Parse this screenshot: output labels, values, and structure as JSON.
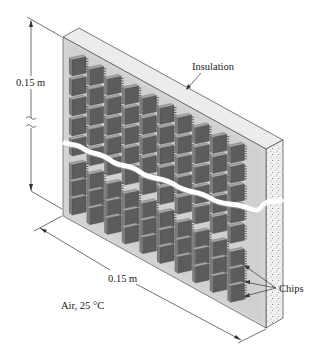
{
  "diagram": {
    "labels": {
      "height_dim": "0.15 m",
      "width_dim": "0.15 m",
      "insulation": "Insulation",
      "chips": "Chips",
      "ambient": "Air, 25 °C"
    },
    "chip_grid": {
      "columns": 10,
      "upper_rows": 5,
      "lower_rows": 3
    },
    "colors": {
      "board": "#d2d2d2",
      "board_edge": "#e8e8e8",
      "chip_face": "#5a5a5a",
      "chip_top": "#9a9a9a",
      "insulation": "#ededed",
      "line": "#333333"
    }
  }
}
